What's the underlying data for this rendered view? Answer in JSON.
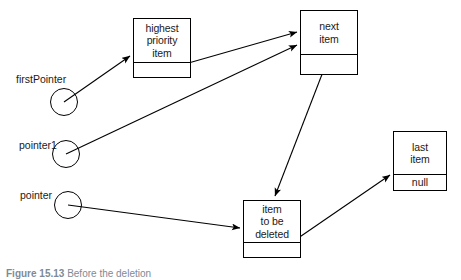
{
  "figure": {
    "caption_label": "Figure 15.13",
    "caption_text": "Before the deletion",
    "width": 461,
    "height": 280,
    "background": "#ffffff",
    "stroke_color": "#000000"
  },
  "nodes": [
    {
      "id": "highest",
      "data": "highest\npriority\nitem",
      "link": ""
    },
    {
      "id": "next",
      "data": "next\nitem",
      "link": ""
    },
    {
      "id": "last",
      "data": "last\nitem",
      "link": "null"
    },
    {
      "id": "deleted",
      "data": "item\nto be\ndeleted",
      "link": ""
    }
  ],
  "pointers": [
    {
      "id": "firstPointer",
      "label": "firstPointer",
      "target": "highest"
    },
    {
      "id": "pointer1",
      "label": "pointer1",
      "target": "next"
    },
    {
      "id": "pointer",
      "label": "pointer",
      "target": "deleted"
    }
  ],
  "arrows": [
    {
      "from": "firstPointer",
      "to": "highest"
    },
    {
      "from": "highest-link",
      "to": "next"
    },
    {
      "from": "pointer1",
      "to": "next"
    },
    {
      "from": "next-link",
      "to": "deleted"
    },
    {
      "from": "pointer",
      "to": "deleted"
    },
    {
      "from": "deleted-link",
      "to": "last"
    }
  ]
}
